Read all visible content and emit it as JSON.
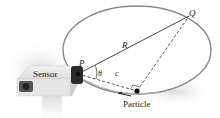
{
  "figure": {
    "labels": {
      "sensor": "Sensor",
      "particle": "Particle",
      "point_p": "P",
      "point_q": "Q",
      "radius": "R",
      "angle": "θ",
      "chord": "c"
    },
    "colors": {
      "ellipse": "#8a8a8a",
      "line": "#333333",
      "dashed": "#444444",
      "sensor_body": "#e4e4e4",
      "sensor_shadow": "#c8c8c8",
      "dot": "#111111"
    }
  }
}
